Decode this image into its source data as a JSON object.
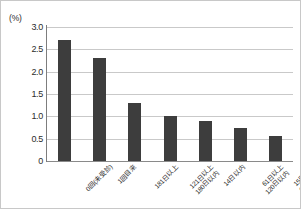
{
  "chart_data": {
    "type": "bar",
    "title": "",
    "xlabel": "",
    "ylabel": "(%)",
    "unit_label": "(%)",
    "categories": [
      "0回(未受診)",
      "1回目来",
      "181日以上",
      "121日以上\n180日以内",
      "14日以内",
      "61日以上\n120日以内",
      "15日以上\n60日以内"
    ],
    "values": [
      2.7,
      2.3,
      1.3,
      1.0,
      0.9,
      0.75,
      0.55
    ],
    "ylim": [
      0,
      3.0
    ],
    "yticks": [
      "3.0",
      "2.5",
      "2.0",
      "1.5",
      "1.0",
      "0.5",
      "0"
    ],
    "ytick_values": [
      3.0,
      2.5,
      2.0,
      1.5,
      1.0,
      0.5,
      0
    ],
    "grid": true,
    "legend": false,
    "bar_color": "#3d3d3d",
    "gridline_color": "#c9c9c9",
    "axis_color": "#7d7d7d"
  }
}
